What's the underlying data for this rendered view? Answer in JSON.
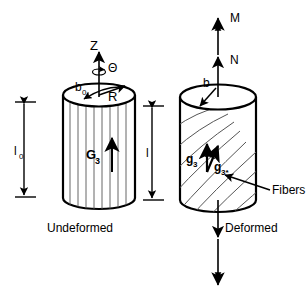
{
  "figure": {
    "stroke_color": "#000000",
    "fiber_color": "#555555",
    "background": "#ffffff"
  },
  "undeformed": {
    "caption": "Undeformed",
    "axis_z": "Z",
    "axis_theta": "Θ",
    "radius_label": "R",
    "fiber_angle_label": "b",
    "fiber_angle_sub": "0",
    "director_label": "G",
    "director_sub": "3",
    "length_label": "l",
    "length_sub": "0"
  },
  "deformed": {
    "caption": "Deformed",
    "load_outer": "M",
    "load_inner": "N",
    "fiber_angle_label": "b",
    "director_label": "g",
    "director_sub": "3",
    "director_star_label": "g",
    "director_star_sub": "3*",
    "length_label": "l",
    "fibers_label": "Fibers"
  }
}
